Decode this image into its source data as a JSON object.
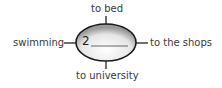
{
  "diagram": {
    "center": {
      "number": "2",
      "answer": ""
    },
    "spokes": {
      "top": "to bed",
      "left": "swimming",
      "right": "to the shops",
      "bottom": "to university"
    }
  }
}
